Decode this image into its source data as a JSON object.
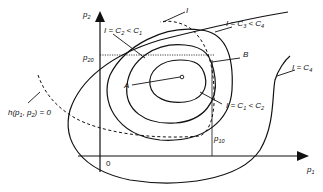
{
  "diagram": {
    "type": "contour-plot",
    "axes": {
      "x_label": "p",
      "x_label_sub": "1",
      "y_label": "p",
      "y_label_sub": "2",
      "origin_label": "0"
    },
    "reference_values": {
      "p10": {
        "base": "p",
        "sub": "10"
      },
      "p20": {
        "base": "p",
        "sub": "20"
      }
    },
    "points": {
      "A": "A",
      "B": "B"
    },
    "curves": {
      "constraint": {
        "text": "h(p",
        "sub1": "1",
        "mid": ", p",
        "sub2": "2",
        "tail": ") = 0"
      },
      "I_generic": "I",
      "contour_c2": {
        "pre": "I = C",
        "sub": "2",
        "mid": " < C",
        "sub2": "1"
      },
      "contour_c3": {
        "pre": "I = C",
        "sub": "3",
        "mid": " < C",
        "sub2": "4"
      },
      "contour_c1": {
        "pre": "I = C",
        "sub": "1",
        "mid": " < C",
        "sub2": "2"
      },
      "contour_c4": {
        "pre": "I = C",
        "sub": "4"
      }
    },
    "colors": {
      "ink": "#111111",
      "background": "#ffffff"
    }
  }
}
